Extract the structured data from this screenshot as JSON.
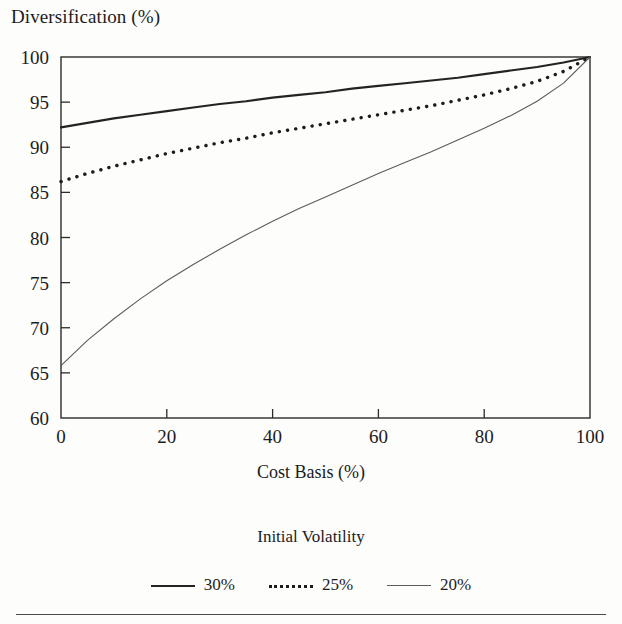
{
  "figure": {
    "y_axis_title": "Diversification (%)",
    "x_axis_title": "Cost Basis (%)",
    "legend_title": "Initial Volatility"
  },
  "axis": {
    "y_ticks": [
      "60",
      "65",
      "70",
      "75",
      "80",
      "85",
      "90",
      "95",
      "100"
    ],
    "x_ticks": [
      "0",
      "20",
      "40",
      "60",
      "80",
      "100"
    ]
  },
  "legend": {
    "items": [
      {
        "label": "30%",
        "style": "solid-thick",
        "color": "#232323"
      },
      {
        "label": "25%",
        "style": "dotted",
        "color": "#1c1c1c"
      },
      {
        "label": "20%",
        "style": "solid-thin",
        "color": "#5c5c5c"
      }
    ]
  },
  "chart_data": {
    "type": "line",
    "title": "",
    "xlabel": "Cost Basis (%)",
    "ylabel": "Diversification (%)",
    "xlim": [
      0,
      100
    ],
    "ylim": [
      60,
      100
    ],
    "xticks": [
      0,
      20,
      40,
      60,
      80,
      100
    ],
    "yticks": [
      60,
      65,
      70,
      75,
      80,
      85,
      90,
      95,
      100
    ],
    "grid": false,
    "legend_title": "Initial Volatility",
    "legend_position": "below-plot-center",
    "x": [
      0,
      5,
      10,
      15,
      20,
      25,
      30,
      35,
      40,
      45,
      50,
      55,
      60,
      65,
      70,
      75,
      80,
      85,
      90,
      95,
      100
    ],
    "series": [
      {
        "name": "30%",
        "linestyle": "solid",
        "linewidth": 2.1,
        "color": "#232323",
        "values": [
          92.2,
          92.7,
          93.2,
          93.6,
          94.0,
          94.4,
          94.8,
          95.1,
          95.5,
          95.8,
          96.1,
          96.5,
          96.8,
          97.1,
          97.4,
          97.7,
          98.1,
          98.5,
          98.9,
          99.4,
          100.0
        ]
      },
      {
        "name": "25%",
        "linestyle": "dotted",
        "linewidth": 3.4,
        "color": "#1c1c1c",
        "values": [
          86.2,
          87.1,
          87.9,
          88.6,
          89.3,
          89.9,
          90.5,
          91.0,
          91.6,
          92.1,
          92.6,
          93.1,
          93.6,
          94.1,
          94.6,
          95.2,
          95.8,
          96.5,
          97.3,
          98.4,
          100.0
        ]
      },
      {
        "name": "20%",
        "linestyle": "solid",
        "linewidth": 1.1,
        "color": "#5c5c5c",
        "values": [
          65.8,
          68.6,
          71.0,
          73.2,
          75.2,
          77.0,
          78.7,
          80.3,
          81.8,
          83.2,
          84.5,
          85.8,
          87.1,
          88.3,
          89.5,
          90.8,
          92.1,
          93.5,
          95.1,
          97.1,
          100.0
        ]
      }
    ]
  }
}
